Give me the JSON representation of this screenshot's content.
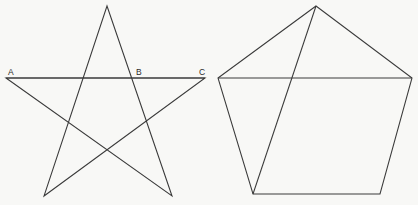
{
  "figure": {
    "background_color": "#f8f8f6",
    "stroke_color": "#3a3a3a",
    "label_color": "#2b2b2b",
    "canvas": {
      "width": 418,
      "height": 205
    },
    "shapes": [
      {
        "name": "pentagram",
        "kind": "star",
        "closed": true,
        "points": "6,78 172,196 107,6 44,196 205,78",
        "description": "five-pointed star drawn as one closed self-intersecting path"
      },
      {
        "name": "chord-AC",
        "kind": "segment",
        "closed": false,
        "points": "6,78 205,78",
        "description": "horizontal line through star points A and C passing through B"
      },
      {
        "name": "pentagon",
        "kind": "polygon",
        "closed": true,
        "points": "316,6 412,78 380,194 253,194 218,78",
        "description": "convex regular pentagon"
      },
      {
        "name": "pentagon-diagonal",
        "kind": "segment",
        "closed": false,
        "points": "316,6 253,194",
        "description": "diagonal from pentagon apex to lower-left vertex"
      },
      {
        "name": "pentagon-upper-chord",
        "kind": "segment",
        "closed": false,
        "points": "218,78 412,78",
        "description": "horizontal chord joining the two upper side vertices"
      }
    ],
    "labels": [
      {
        "name": "label-a",
        "text": "A",
        "x": 8,
        "y": 75,
        "anchor": "start"
      },
      {
        "name": "label-b",
        "text": "B",
        "x": 136,
        "y": 75,
        "anchor": "start"
      },
      {
        "name": "label-c",
        "text": "C",
        "x": 199,
        "y": 75,
        "anchor": "start"
      }
    ]
  }
}
